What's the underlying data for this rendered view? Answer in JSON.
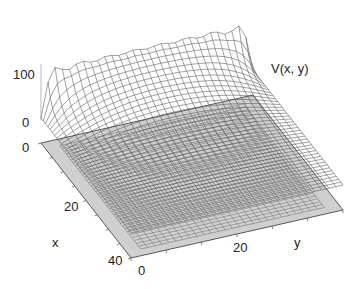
{
  "chart_data": {
    "type": "surface",
    "title": "",
    "zlabel": "V(x, y)",
    "xlabel": "x",
    "ylabel": "y",
    "x_range": [
      0,
      40
    ],
    "y_range": [
      0,
      30
    ],
    "z_range": [
      0,
      100
    ],
    "x_ticks": [
      "0",
      "20",
      "40"
    ],
    "y_ticks": [
      "0",
      "20"
    ],
    "z_ticks": [
      "0",
      "100"
    ],
    "grid": {
      "nx": 40,
      "ny": 30
    },
    "boundary_value": 100,
    "colors": {
      "mesh": "#555555",
      "floor": "#cfcfcf",
      "floor_grid": "#6a6a6a",
      "axis": "#333333"
    }
  },
  "labels": {
    "zlabel": "V(x, y)",
    "z_tick_100": "100",
    "z_tick_0": "0",
    "x_tick_0": "0",
    "x_tick_20": "20",
    "x_tick_40": "40",
    "x_label": "x",
    "y_tick_0": "0",
    "y_tick_20": "20",
    "y_label": "y"
  }
}
